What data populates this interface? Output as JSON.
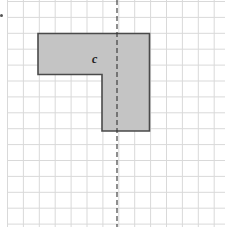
{
  "figure": {
    "type": "grid-reflection-diagram",
    "grid": {
      "cell_size": 15.9,
      "origin_x": 7.5,
      "origin_y": 1.5,
      "columns": 14,
      "rows": 14,
      "line_color": "#d9d9d9"
    },
    "shape": {
      "label": "c",
      "fill_color": "#c4c4c4",
      "stroke_color": "#4a4a4a",
      "points_px": [
        [
          38,
          33.5
        ],
        [
          149.5,
          33.5
        ],
        [
          149.5,
          131
        ],
        [
          102,
          131
        ],
        [
          102,
          74.5
        ],
        [
          38,
          74.5
        ]
      ],
      "label_pos": [
        92,
        63
      ]
    },
    "mirror_line": {
      "style": "dashed",
      "orientation": "vertical",
      "x": 117,
      "color": "#333333"
    }
  }
}
